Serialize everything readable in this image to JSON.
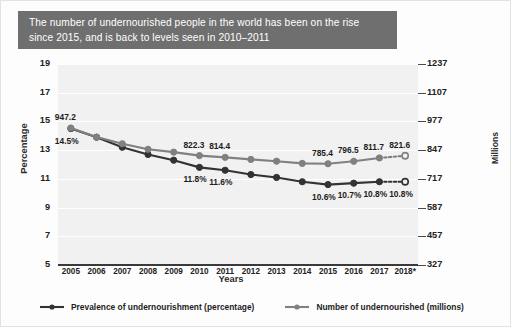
{
  "title": {
    "line1": "The number of undernourished people in the world has been on the rise",
    "line2": "since 2015, and is back to levels seen in 2010–2011"
  },
  "axes": {
    "ylabel_left": "Percentage",
    "ylabel_right": "Millions",
    "xlabel": "Years"
  },
  "colors": {
    "banner": "#6f6f6f",
    "series_percentage": "#333333",
    "series_millions": "#808080",
    "plot_background": "#f1f1f1",
    "gridline": "#ffffff"
  },
  "legend": {
    "items": [
      {
        "label": "Prevalence of undernourishment (percentage)",
        "color": "#333333"
      },
      {
        "label": "Number of undernourished (millions)",
        "color": "#808080"
      }
    ]
  },
  "chart_data": {
    "type": "line",
    "title": "The number of undernourished people in the world has been on the rise since 2015, and is back to levels seen in 2010–2011",
    "xlabel": "Years",
    "ylabel": "Percentage",
    "ylabel_secondary": "Millions",
    "grid": true,
    "legend_position": "bottom",
    "categories": [
      "2005",
      "2006",
      "2007",
      "2008",
      "2009",
      "2010",
      "2011",
      "2012",
      "2013",
      "2014",
      "2015",
      "2016",
      "2017",
      "2018*"
    ],
    "x_tick_labels": [
      "2005",
      "2006",
      "2007",
      "2008",
      "2009",
      "2010",
      "2011",
      "2012",
      "2013",
      "2014",
      "2015",
      "2016",
      "2017",
      "2018*"
    ],
    "y_left_ticks": [
      5,
      7,
      9,
      11,
      13,
      15,
      17,
      19
    ],
    "y_left_lim": [
      5,
      19
    ],
    "y_right_ticks": [
      327,
      457,
      587,
      717,
      847,
      977,
      1107,
      1237
    ],
    "y_right_lim": [
      327,
      1237
    ],
    "series": [
      {
        "name": "Prevalence of undernourishment (percentage)",
        "axis": "left",
        "color": "#333333",
        "unit": "%",
        "values": [
          14.5,
          13.9,
          13.2,
          12.7,
          12.3,
          11.8,
          11.6,
          11.3,
          11.1,
          10.8,
          10.6,
          10.7,
          10.8,
          10.8
        ],
        "labeled_points": [
          {
            "x": "2005",
            "value": 14.5,
            "text": "14.5%"
          },
          {
            "x": "2010",
            "value": 11.8,
            "text": "11.8%"
          },
          {
            "x": "2011",
            "value": 11.6,
            "text": "11.6%"
          },
          {
            "x": "2015",
            "value": 10.6,
            "text": "10.6%"
          },
          {
            "x": "2016",
            "value": 10.7,
            "text": "10.7%"
          },
          {
            "x": "2017",
            "value": 10.8,
            "text": "10.8%"
          },
          {
            "x": "2018*",
            "value": 10.8,
            "text": "10.8%"
          }
        ],
        "projected_from": "2017"
      },
      {
        "name": "Number of undernourished (millions)",
        "axis": "right",
        "color": "#808080",
        "unit": "millions",
        "values": [
          947.2,
          906.0,
          876.0,
          851.0,
          838.0,
          822.3,
          814.4,
          805.0,
          797.0,
          787.0,
          785.4,
          796.5,
          811.7,
          821.6
        ],
        "labeled_points": [
          {
            "x": "2005",
            "value": 947.2,
            "text": "947.2"
          },
          {
            "x": "2010",
            "value": 822.3,
            "text": "822.3"
          },
          {
            "x": "2011",
            "value": 814.4,
            "text": "814.4"
          },
          {
            "x": "2015",
            "value": 785.4,
            "text": "785.4"
          },
          {
            "x": "2016",
            "value": 796.5,
            "text": "796.5"
          },
          {
            "x": "2017",
            "value": 811.7,
            "text": "811.7"
          },
          {
            "x": "2018*",
            "value": 821.6,
            "text": "821.6"
          }
        ],
        "projected_from": "2017"
      }
    ]
  }
}
